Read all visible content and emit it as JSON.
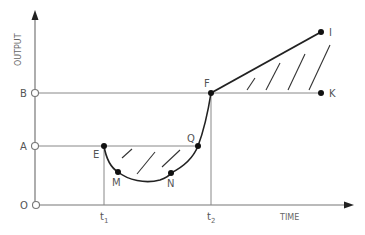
{
  "diagram": {
    "y_axis_label": "OUTPUT",
    "x_axis_label": "TIME",
    "y_levels": [
      {
        "label": "B",
        "y": 93
      },
      {
        "label": "A",
        "y": 146
      },
      {
        "label": "O",
        "y": 205
      }
    ],
    "x_ticks": [
      {
        "label": "t",
        "sub": "1",
        "x": 104
      },
      {
        "label": "t",
        "sub": "2",
        "x": 211
      }
    ],
    "points": {
      "E": {
        "label": "E"
      },
      "M": {
        "label": "M"
      },
      "N": {
        "label": "N"
      },
      "Q": {
        "label": "Q"
      },
      "F": {
        "label": "F"
      },
      "I": {
        "label": "I"
      },
      "K": {
        "label": "K"
      }
    },
    "colors": {
      "line": "#222222",
      "axis": "#777777",
      "text": "#555555"
    }
  }
}
